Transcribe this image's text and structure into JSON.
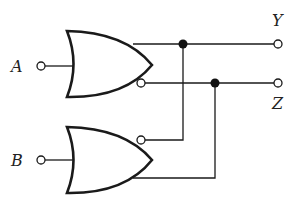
{
  "diagram": {
    "type": "logic-circuit",
    "inputs": [
      {
        "label": "A",
        "gate": "top"
      },
      {
        "label": "B",
        "gate": "bottom"
      }
    ],
    "outputs": [
      {
        "label": "Y"
      },
      {
        "label": "Z"
      }
    ],
    "gates": [
      {
        "id": "top",
        "kind": "OR",
        "outputs": [
          "normal",
          "inverted"
        ]
      },
      {
        "id": "bottom",
        "kind": "OR",
        "outputs": [
          "inverted",
          "normal"
        ]
      }
    ],
    "connections": [
      "top.normal -> Y (junction feeds bottom.inverted-input-side)",
      "top.inverted -> Z (junction feeds bottom.normal-side)"
    ],
    "colors": {
      "line": "#1a1a1a",
      "background": "#ffffff"
    }
  }
}
